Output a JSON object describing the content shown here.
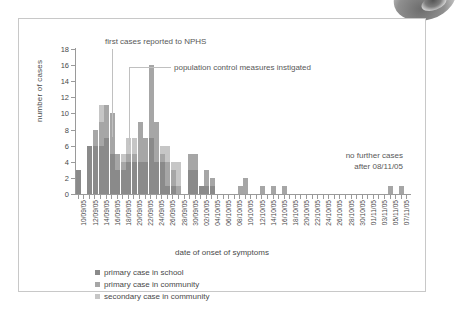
{
  "chart_data": {
    "type": "bar",
    "stacked": true,
    "title": "",
    "xlabel": "date of onset of symptoms",
    "ylabel": "number of cases",
    "ylim": [
      0,
      18
    ],
    "yticks": [
      0,
      2,
      4,
      6,
      8,
      10,
      12,
      14,
      16,
      18
    ],
    "grid": false,
    "legend_position": "below-left",
    "series": [
      {
        "name": "primary case in school",
        "color": "#8a8a8a",
        "values": [
          3,
          0,
          6,
          6,
          6,
          7,
          5,
          3,
          3,
          4,
          4,
          4,
          4,
          7,
          4,
          4,
          1,
          1,
          0,
          0,
          3,
          3,
          1,
          1,
          1,
          0,
          0,
          0,
          0,
          0,
          0,
          0,
          0,
          0,
          0,
          0,
          0,
          0,
          0,
          0,
          0,
          0,
          0,
          0,
          0,
          0,
          0,
          0,
          0,
          0,
          0,
          0,
          0,
          0,
          0,
          0,
          0,
          0,
          0,
          0
        ]
      },
      {
        "name": "primary case in community",
        "color": "#a6a6a6",
        "values": [
          0,
          0,
          0,
          2,
          3,
          4,
          5,
          2,
          1,
          1,
          1,
          5,
          3,
          9,
          5,
          1,
          3,
          2,
          1,
          0,
          2,
          2,
          0,
          2,
          1,
          0,
          0,
          0,
          0,
          1,
          2,
          0,
          0,
          1,
          0,
          1,
          0,
          1,
          0,
          0,
          0,
          0,
          0,
          0,
          0,
          0,
          0,
          0,
          0,
          0,
          0,
          0,
          0,
          0,
          0,
          0,
          1,
          0,
          1,
          0
        ]
      },
      {
        "name": "secondary case in community",
        "color": "#c6c6c6",
        "values": [
          0,
          0,
          0,
          0,
          2,
          0,
          0,
          0,
          1,
          2,
          2,
          0,
          0,
          0,
          0,
          1,
          2,
          1,
          3,
          0,
          0,
          0,
          0,
          0,
          0,
          0,
          0,
          0,
          0,
          0,
          0,
          0,
          0,
          0,
          0,
          0,
          0,
          0,
          0,
          0,
          0,
          0,
          0,
          0,
          0,
          0,
          0,
          0,
          0,
          0,
          0,
          0,
          0,
          0,
          0,
          0,
          0,
          0,
          0,
          0
        ]
      }
    ],
    "categories": [
      "10/09/05",
      "11/09/05",
      "12/09/05",
      "13/09/05",
      "14/09/05",
      "15/09/05",
      "16/09/05",
      "17/09/05",
      "18/09/05",
      "19/09/05",
      "20/09/05",
      "21/09/05",
      "22/09/05",
      "23/09/05",
      "24/09/05",
      "25/09/05",
      "26/09/05",
      "27/09/05",
      "28/09/05",
      "29/09/05",
      "30/09/05",
      "01/10/05",
      "02/10/05",
      "03/10/05",
      "04/10/05",
      "05/10/05",
      "06/10/05",
      "07/10/05",
      "08/10/05",
      "09/10/05",
      "10/10/05",
      "11/10/05",
      "12/10/05",
      "13/10/05",
      "14/10/05",
      "15/10/05",
      "16/10/05",
      "17/10/05",
      "18/10/05",
      "19/10/05",
      "20/10/05",
      "21/10/05",
      "22/10/05",
      "23/10/05",
      "24/10/05",
      "25/10/05",
      "26/10/05",
      "27/10/05",
      "28/10/05",
      "29/10/05",
      "30/10/05",
      "31/10/05",
      "01/11/05",
      "02/11/05",
      "03/11/05",
      "04/11/05",
      "05/11/05",
      "06/11/05",
      "07/11/05",
      "08/11/05"
    ],
    "tick_labels": [
      "10/09/05",
      "12/09/05",
      "14/09/05",
      "16/09/05",
      "18/09/05",
      "20/09/05",
      "22/09/05",
      "24/09/05",
      "26/09/05",
      "28/09/05",
      "30/09/05",
      "02/10/05",
      "04/10/05",
      "06/10/05",
      "08/10/05",
      "10/10/05",
      "12/10/05",
      "14/10/05",
      "16/10/05",
      "18/10/05",
      "20/10/05",
      "22/10/05",
      "24/10/05",
      "26/10/05",
      "28/10/05",
      "30/10/05",
      "01/11/05",
      "03/11/05",
      "05/11/05",
      "07/11/05"
    ],
    "annotations": [
      {
        "text": "first cases reported to NPHS",
        "points_to": "16/09/05"
      },
      {
        "text": "population control measures instigated",
        "points_to": "19/09/05"
      },
      {
        "text_line1": "no further cases",
        "text_line2": "after 08/11/05"
      }
    ]
  },
  "axis": {
    "y_title": "number of cases",
    "x_title": "date of onset of symptoms"
  },
  "annotations": {
    "first_cases": "first cases reported to NPHS",
    "population_control": "population control measures instigated",
    "no_further_line1": "no further cases",
    "no_further_line2": "after 08/11/05"
  },
  "legend": {
    "items": [
      {
        "label": "primary case in school",
        "color": "#8a8a8a",
        "icon": "square-swatch-icon"
      },
      {
        "label": "primary case in community",
        "color": "#a6a6a6",
        "icon": "square-swatch-icon"
      },
      {
        "label": "secondary case in community",
        "color": "#c6c6c6",
        "icon": "square-swatch-icon"
      }
    ]
  }
}
